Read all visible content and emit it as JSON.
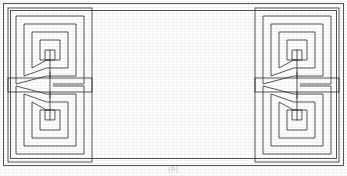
{
  "figure": {
    "title": "Decorative rectangular panel with four square-spiral meander motifs",
    "kind": "line-drawing",
    "caption": "(b)",
    "width": 347,
    "height": 176,
    "background_color": "#ffffff",
    "ink_color": "#3a3a3a",
    "line_width": 0.85
  },
  "frame": {
    "outer_border": {
      "label": "Outer frame line",
      "x": 3.5,
      "y": 3.5,
      "width": 340,
      "height": 162,
      "color": "#3a3a3a"
    },
    "inner_border": {
      "label": "Inner frame line",
      "x": 10.5,
      "y": 10.5,
      "width": 326,
      "height": 148,
      "color": "#3a3a3a"
    }
  },
  "motifs": [
    {
      "id": "spiral-top-left",
      "label": "Top-left square spiral",
      "corner": "top-left",
      "center_x": 50,
      "center_y": 50,
      "outer_half_size": 34,
      "ring_count": 4,
      "ring_gap": 8,
      "arm_direction": "down",
      "flip_x": 1,
      "flip_y": 1
    },
    {
      "id": "spiral-bottom-left",
      "label": "Bottom-left square spiral",
      "corner": "bottom-left",
      "center_x": 50,
      "center_y": 120,
      "outer_half_size": 34,
      "ring_count": 4,
      "ring_gap": 8,
      "arm_direction": "up",
      "flip_x": 1,
      "flip_y": -1
    },
    {
      "id": "spiral-top-right",
      "label": "Top-right square spiral",
      "corner": "top-right",
      "center_x": 297,
      "center_y": 50,
      "outer_half_size": 34,
      "ring_count": 4,
      "ring_gap": 8,
      "arm_direction": "down",
      "flip_x": 1,
      "flip_y": 1
    },
    {
      "id": "spiral-bottom-right",
      "label": "Bottom-right square spiral",
      "corner": "bottom-right",
      "center_x": 297,
      "center_y": 120,
      "outer_half_size": 34,
      "ring_count": 4,
      "ring_gap": 8,
      "arm_direction": "up",
      "flip_x": 1,
      "flip_y": -1
    }
  ],
  "connectors": [
    {
      "id": "connector-left",
      "label": "Left vertical connector between spirals",
      "x": 50,
      "y1": 50,
      "y2": 120
    },
    {
      "id": "connector-right",
      "label": "Right vertical connector between spirals",
      "x": 297,
      "y1": 50,
      "y2": 120
    }
  ]
}
